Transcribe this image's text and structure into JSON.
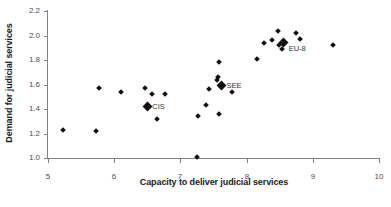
{
  "chart_data": {
    "type": "scatter",
    "title": "",
    "xlabel": "Capacity to deliver judicial services",
    "ylabel": "Demand for judicial services",
    "xlim": [
      5,
      10
    ],
    "ylim": [
      1.0,
      2.2
    ],
    "xticks": [
      "5",
      "6",
      "7",
      "8",
      "9",
      "10"
    ],
    "yticks": [
      "1.0",
      "1.2",
      "1.4",
      "1.6",
      "1.8",
      "2.0",
      "2.2"
    ],
    "grid": false,
    "legend": "none",
    "marker": "diamond",
    "marker_color": "#111111",
    "series": [
      {
        "name": "countries",
        "points": [
          {
            "x": 5.22,
            "y": 1.23
          },
          {
            "x": 5.73,
            "y": 1.22
          },
          {
            "x": 5.77,
            "y": 1.57
          },
          {
            "x": 6.11,
            "y": 1.54
          },
          {
            "x": 6.47,
            "y": 1.57
          },
          {
            "x": 6.57,
            "y": 1.52
          },
          {
            "x": 6.65,
            "y": 1.32
          },
          {
            "x": 6.76,
            "y": 1.52
          },
          {
            "x": 6.5,
            "y": 1.42
          },
          {
            "x": 7.25,
            "y": 1.01
          },
          {
            "x": 7.26,
            "y": 1.34
          },
          {
            "x": 7.39,
            "y": 1.43
          },
          {
            "x": 7.43,
            "y": 1.56
          },
          {
            "x": 7.55,
            "y": 1.64
          },
          {
            "x": 7.57,
            "y": 1.66
          },
          {
            "x": 7.58,
            "y": 1.36
          },
          {
            "x": 7.59,
            "y": 1.78
          },
          {
            "x": 7.62,
            "y": 1.6
          },
          {
            "x": 7.78,
            "y": 1.54
          },
          {
            "x": 8.16,
            "y": 1.81
          },
          {
            "x": 8.26,
            "y": 1.94
          },
          {
            "x": 8.38,
            "y": 1.96
          },
          {
            "x": 8.47,
            "y": 2.04
          },
          {
            "x": 8.49,
            "y": 1.92
          },
          {
            "x": 8.54,
            "y": 1.89
          },
          {
            "x": 8.74,
            "y": 2.02
          },
          {
            "x": 8.8,
            "y": 1.97
          },
          {
            "x": 9.3,
            "y": 1.92
          }
        ]
      },
      {
        "name": "group-averages",
        "points": [
          {
            "x": 6.5,
            "y": 1.42,
            "label": "CIS"
          },
          {
            "x": 7.62,
            "y": 1.59,
            "label": "SEE"
          },
          {
            "x": 8.56,
            "y": 1.94,
            "label": "EU-8"
          }
        ]
      }
    ]
  }
}
